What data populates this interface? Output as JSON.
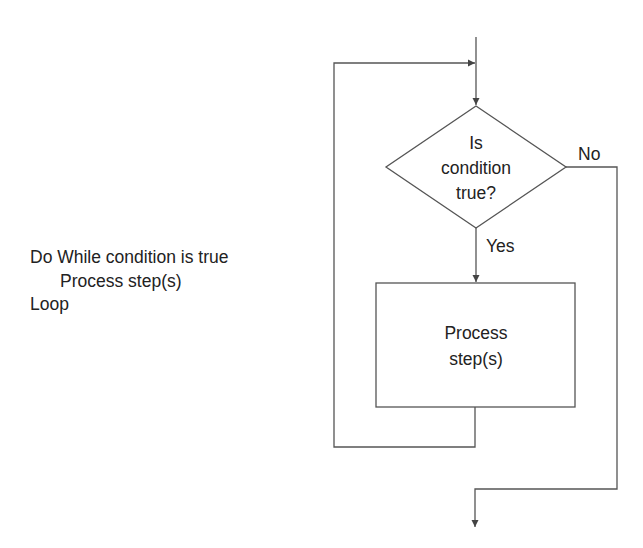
{
  "pseudocode": {
    "lines": [
      "Do While condition is true",
      "Process step(s)",
      "Loop"
    ]
  },
  "flowchart": {
    "decision": {
      "lines": [
        "Is",
        "condition",
        "true?"
      ]
    },
    "yes_label": "Yes",
    "no_label": "No",
    "process": {
      "lines": [
        "Process",
        "step(s)"
      ]
    }
  },
  "colors": {
    "stroke": "#555555",
    "text": "#222222",
    "background": "#ffffff"
  }
}
